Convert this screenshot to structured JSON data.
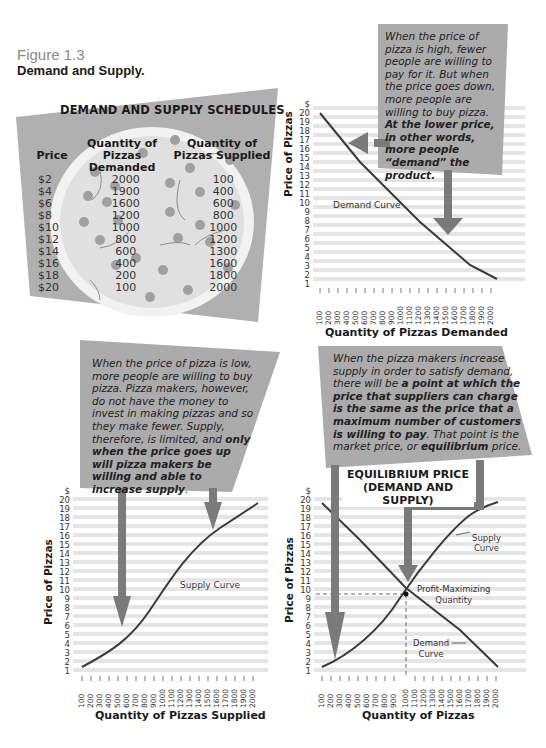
{
  "figure": {
    "number": "Figure 1.3",
    "title": "Demand and Supply."
  },
  "schedule": {
    "title": "DEMAND AND SUPPLY SCHEDULES",
    "headers": {
      "price": "Price",
      "demanded_top": "Quantity of",
      "demanded_bottom": "Pizzas Demanded",
      "supplied_top": "Quantity of",
      "supplied_bottom": "Pizzas Supplied"
    },
    "rows": [
      {
        "price": "$2",
        "demanded": "2000",
        "supplied": "100"
      },
      {
        "price": "$4",
        "demanded": "1900",
        "supplied": "400"
      },
      {
        "price": "$6",
        "demanded": "1600",
        "supplied": "600"
      },
      {
        "price": "$8",
        "demanded": "1200",
        "supplied": "800"
      },
      {
        "price": "$10",
        "demanded": "1000",
        "supplied": "1000"
      },
      {
        "price": "$12",
        "demanded": "800",
        "supplied": "1200"
      },
      {
        "price": "$14",
        "demanded": "600",
        "supplied": "1300"
      },
      {
        "price": "$16",
        "demanded": "400",
        "supplied": "1600"
      },
      {
        "price": "$18",
        "demanded": "200",
        "supplied": "1800"
      },
      {
        "price": "$20",
        "demanded": "100",
        "supplied": "2000"
      }
    ]
  },
  "callouts": {
    "demand": {
      "normal": "When the price of pizza is high, fewer people are willing to pay for it. But when the price goes down, more people are willing to buy pizza. ",
      "bold": "At the lower price, in other words, more people “demand” the product."
    },
    "supply": {
      "normal": "When the price of pizza is low, more people are willing to buy pizza. Pizza makers, however, do not have the money to invest in making pizzas and so they make fewer. Supply, therefore, is limited, and ",
      "bold": "only when the price goes up will pizza makers be willing and able to increase supply",
      "tail": "."
    },
    "equilibrium": {
      "normal1": "When the pizza makers increase supply in order to satisfy demand, there will be ",
      "bold1": "a point at which the price that suppliers can charge is the same as the price that a maximum number of customers is willing to pay",
      "normal2": ". That point is the market price, or ",
      "bold2": "equilibrium",
      "normal3": " price."
    }
  },
  "equilibrium_title": {
    "line1": "EQUILIBRIUM PRICE",
    "line2": "(DEMAND AND SUPPLY)"
  },
  "colors": {
    "callout_bg": "#ababab",
    "arrow": "#7a7a7a",
    "grid_band": "#e3e3e3",
    "curve": "#3a3a3a",
    "pizza_crust": "#e6e6e6",
    "pizza_topping": "#9a9a9a"
  },
  "chart_data": [
    {
      "type": "line",
      "title": "Demand Curve",
      "xlabel": "Quantity of Pizzas Demanded",
      "ylabel": "Price of Pizzas",
      "y_unit": "$",
      "x_ticks": [
        100,
        200,
        300,
        400,
        500,
        600,
        700,
        800,
        900,
        1000,
        1100,
        1200,
        1300,
        1400,
        1500,
        1600,
        1700,
        1800,
        1900,
        2000
      ],
      "y_ticks": [
        1,
        2,
        3,
        4,
        5,
        6,
        7,
        8,
        9,
        10,
        11,
        12,
        13,
        14,
        15,
        16,
        17,
        18,
        19,
        20
      ],
      "series": [
        {
          "name": "Demand Curve",
          "x": [
            100,
            200,
            400,
            600,
            800,
            1000,
            1200,
            1600,
            1900,
            2000
          ],
          "y": [
            20,
            18,
            16,
            14,
            12,
            10,
            8,
            6,
            4,
            2
          ]
        }
      ],
      "xlim": [
        100,
        2000
      ],
      "ylim": [
        1,
        20
      ],
      "grid": true
    },
    {
      "type": "line",
      "title": "Supply Curve",
      "xlabel": "Quantity of Pizzas Supplied",
      "ylabel": "Price of Pizzas",
      "y_unit": "$",
      "x_ticks": [
        100,
        200,
        300,
        400,
        500,
        600,
        700,
        800,
        900,
        1000,
        1100,
        1200,
        1300,
        1400,
        1500,
        1600,
        1700,
        1800,
        1900,
        2000
      ],
      "y_ticks": [
        1,
        2,
        3,
        4,
        5,
        6,
        7,
        8,
        9,
        10,
        11,
        12,
        13,
        14,
        15,
        16,
        17,
        18,
        19,
        20
      ],
      "series": [
        {
          "name": "Supply Curve",
          "x": [
            100,
            400,
            600,
            800,
            1000,
            1200,
            1300,
            1600,
            1800,
            2000
          ],
          "y": [
            2,
            4,
            6,
            8,
            10,
            12,
            14,
            16,
            18,
            20
          ]
        }
      ],
      "xlim": [
        100,
        2000
      ],
      "ylim": [
        1,
        20
      ],
      "grid": true
    },
    {
      "type": "line",
      "title": "EQUILIBRIUM PRICE (DEMAND AND SUPPLY)",
      "xlabel": "Quantity of Pizzas",
      "ylabel": "Price of Pizzas",
      "y_unit": "$",
      "x_ticks": [
        100,
        200,
        300,
        400,
        500,
        600,
        700,
        800,
        900,
        1000,
        1100,
        1200,
        1300,
        1400,
        1500,
        1600,
        1700,
        1800,
        1900,
        2000
      ],
      "y_ticks": [
        1,
        2,
        3,
        4,
        5,
        6,
        7,
        8,
        9,
        10,
        11,
        12,
        13,
        14,
        15,
        16,
        17,
        18,
        19,
        20
      ],
      "series": [
        {
          "name": "Demand Curve",
          "x": [
            100,
            200,
            400,
            600,
            800,
            1000,
            1200,
            1600,
            1900,
            2000
          ],
          "y": [
            20,
            18,
            16,
            14,
            12,
            10,
            8,
            6,
            4,
            2
          ]
        },
        {
          "name": "Supply Curve",
          "x": [
            100,
            400,
            600,
            800,
            1000,
            1200,
            1300,
            1600,
            1800,
            2000
          ],
          "y": [
            2,
            4,
            6,
            8,
            10,
            12,
            14,
            16,
            18,
            20
          ]
        }
      ],
      "annotations": [
        {
          "text": "Profit-Maximizing Quantity",
          "x": 1000,
          "y": 10
        },
        {
          "text": "Supply Curve"
        },
        {
          "text": "Demand Curve"
        }
      ],
      "equilibrium": {
        "x": 1000,
        "y": 10
      },
      "xlim": [
        100,
        2000
      ],
      "ylim": [
        1,
        20
      ],
      "grid": true
    }
  ],
  "labels": {
    "demand_curve": "Demand Curve",
    "supply_curve": "Supply Curve",
    "supply_curve_l1": "Supply",
    "supply_curve_l2": "Curve",
    "demand_curve_l1": "Demand",
    "demand_curve_l2": "Curve",
    "pmq_l1": "Profit-Maximizing",
    "pmq_l2": "Quantity",
    "ylabel": "Price of Pizzas",
    "xlabel_demand": "Quantity of Pizzas Demanded",
    "xlabel_supply": "Quantity of Pizzas Supplied",
    "xlabel_eq": "Quantity of Pizzas",
    "dollar": "$"
  }
}
